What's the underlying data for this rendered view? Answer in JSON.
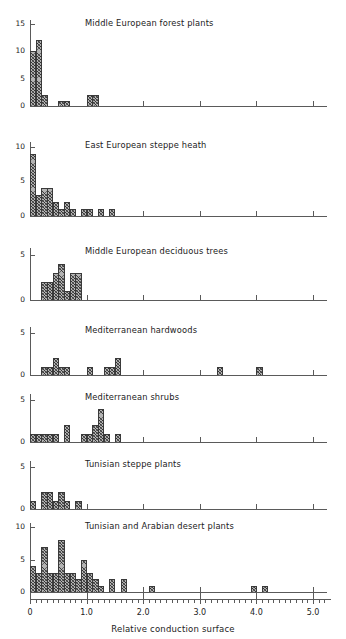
{
  "figure": {
    "xaxis_caption": "Relative conduction surface",
    "x_tick_labels": [
      "0",
      "1.0",
      "2.0",
      "3.0",
      "4.0",
      "5.0"
    ]
  },
  "chart_data": [
    {
      "type": "bar",
      "title": "Middle European forest plants",
      "xlabel": "Relative conduction surface",
      "ylabel": "",
      "xlim": [
        0,
        5.25
      ],
      "ylim": [
        0,
        16
      ],
      "yticks": [
        0,
        5,
        10,
        15
      ],
      "ytick_labels": [
        "0",
        "5",
        "10",
        "15"
      ],
      "bin_width": 0.1,
      "bins": [
        {
          "x": 0.0,
          "value": 10
        },
        {
          "x": 0.1,
          "value": 12
        },
        {
          "x": 0.2,
          "value": 2
        },
        {
          "x": 0.5,
          "value": 1
        },
        {
          "x": 0.6,
          "value": 1
        },
        {
          "x": 1.0,
          "value": 2
        },
        {
          "x": 1.1,
          "value": 2
        }
      ]
    },
    {
      "type": "bar",
      "title": "East European steppe heath",
      "xlabel": "Relative conduction surface",
      "ylabel": "",
      "xlim": [
        0,
        5.25
      ],
      "ylim": [
        0,
        11
      ],
      "yticks": [
        0,
        5,
        10
      ],
      "ytick_labels": [
        "0",
        "5",
        "10"
      ],
      "bin_width": 0.1,
      "bins": [
        {
          "x": 0.0,
          "value": 9
        },
        {
          "x": 0.1,
          "value": 3
        },
        {
          "x": 0.2,
          "value": 4
        },
        {
          "x": 0.3,
          "value": 4
        },
        {
          "x": 0.4,
          "value": 2
        },
        {
          "x": 0.5,
          "value": 1
        },
        {
          "x": 0.6,
          "value": 2
        },
        {
          "x": 0.7,
          "value": 1
        },
        {
          "x": 0.9,
          "value": 1
        },
        {
          "x": 1.0,
          "value": 1
        },
        {
          "x": 1.2,
          "value": 1
        },
        {
          "x": 1.4,
          "value": 1
        }
      ]
    },
    {
      "type": "bar",
      "title": "Middle European deciduous trees",
      "xlabel": "Relative conduction surface",
      "ylabel": "",
      "xlim": [
        0,
        5.25
      ],
      "ylim": [
        0,
        6
      ],
      "yticks": [
        0,
        5
      ],
      "ytick_labels": [
        "0",
        "5"
      ],
      "bin_width": 0.1,
      "bins": [
        {
          "x": 0.2,
          "value": 2
        },
        {
          "x": 0.3,
          "value": 2
        },
        {
          "x": 0.4,
          "value": 3
        },
        {
          "x": 0.5,
          "value": 4
        },
        {
          "x": 0.6,
          "value": 1
        },
        {
          "x": 0.7,
          "value": 3
        },
        {
          "x": 0.8,
          "value": 3
        }
      ]
    },
    {
      "type": "bar",
      "title": "Mediterranean hardwoods",
      "xlabel": "Relative conduction surface",
      "ylabel": "",
      "xlim": [
        0,
        5.25
      ],
      "ylim": [
        0,
        6
      ],
      "yticks": [
        0,
        5
      ],
      "ytick_labels": [
        "0",
        "5"
      ],
      "bin_width": 0.1,
      "bins": [
        {
          "x": 0.2,
          "value": 1
        },
        {
          "x": 0.3,
          "value": 1
        },
        {
          "x": 0.4,
          "value": 2
        },
        {
          "x": 0.5,
          "value": 1
        },
        {
          "x": 0.6,
          "value": 1
        },
        {
          "x": 1.0,
          "value": 1
        },
        {
          "x": 1.3,
          "value": 1
        },
        {
          "x": 1.4,
          "value": 1
        },
        {
          "x": 1.5,
          "value": 2
        },
        {
          "x": 3.3,
          "value": 1
        },
        {
          "x": 4.0,
          "value": 1
        }
      ]
    },
    {
      "type": "bar",
      "title": "Mediterranean shrubs",
      "xlabel": "Relative conduction surface",
      "ylabel": "",
      "xlim": [
        0,
        5.25
      ],
      "ylim": [
        0,
        6
      ],
      "yticks": [
        0,
        5
      ],
      "ytick_labels": [
        "0",
        "5"
      ],
      "bin_width": 0.1,
      "bins": [
        {
          "x": 0.0,
          "value": 1
        },
        {
          "x": 0.1,
          "value": 1
        },
        {
          "x": 0.2,
          "value": 1
        },
        {
          "x": 0.3,
          "value": 1
        },
        {
          "x": 0.4,
          "value": 1
        },
        {
          "x": 0.6,
          "value": 2
        },
        {
          "x": 0.9,
          "value": 1
        },
        {
          "x": 1.0,
          "value": 1
        },
        {
          "x": 1.1,
          "value": 2
        },
        {
          "x": 1.2,
          "value": 4
        },
        {
          "x": 1.3,
          "value": 1
        },
        {
          "x": 1.5,
          "value": 1
        }
      ]
    },
    {
      "type": "bar",
      "title": "Tunisian steppe plants",
      "xlabel": "Relative conduction surface",
      "ylabel": "",
      "xlim": [
        0,
        5.25
      ],
      "ylim": [
        0,
        6
      ],
      "yticks": [
        0,
        5
      ],
      "ytick_labels": [
        "0",
        "5"
      ],
      "bin_width": 0.1,
      "bins": [
        {
          "x": 0.0,
          "value": 1
        },
        {
          "x": 0.2,
          "value": 2
        },
        {
          "x": 0.3,
          "value": 2
        },
        {
          "x": 0.4,
          "value": 1
        },
        {
          "x": 0.5,
          "value": 2
        },
        {
          "x": 0.6,
          "value": 1
        },
        {
          "x": 0.8,
          "value": 1
        }
      ]
    },
    {
      "type": "bar",
      "title": "Tunisian and Arabian desert plants",
      "xlabel": "Relative conduction surface",
      "ylabel": "",
      "xlim": [
        0,
        5.25
      ],
      "ylim": [
        0,
        11
      ],
      "yticks": [
        0,
        5,
        10
      ],
      "ytick_labels": [
        "0",
        "5",
        "10"
      ],
      "bin_width": 0.1,
      "bins": [
        {
          "x": 0.0,
          "value": 4
        },
        {
          "x": 0.1,
          "value": 3
        },
        {
          "x": 0.2,
          "value": 7
        },
        {
          "x": 0.3,
          "value": 3
        },
        {
          "x": 0.4,
          "value": 3
        },
        {
          "x": 0.5,
          "value": 8
        },
        {
          "x": 0.6,
          "value": 3
        },
        {
          "x": 0.7,
          "value": 3
        },
        {
          "x": 0.8,
          "value": 2
        },
        {
          "x": 0.9,
          "value": 5
        },
        {
          "x": 1.0,
          "value": 3
        },
        {
          "x": 1.1,
          "value": 2
        },
        {
          "x": 1.2,
          "value": 1
        },
        {
          "x": 1.4,
          "value": 2
        },
        {
          "x": 1.6,
          "value": 2
        },
        {
          "x": 2.1,
          "value": 1
        },
        {
          "x": 3.9,
          "value": 1
        },
        {
          "x": 4.1,
          "value": 1
        }
      ]
    }
  ]
}
